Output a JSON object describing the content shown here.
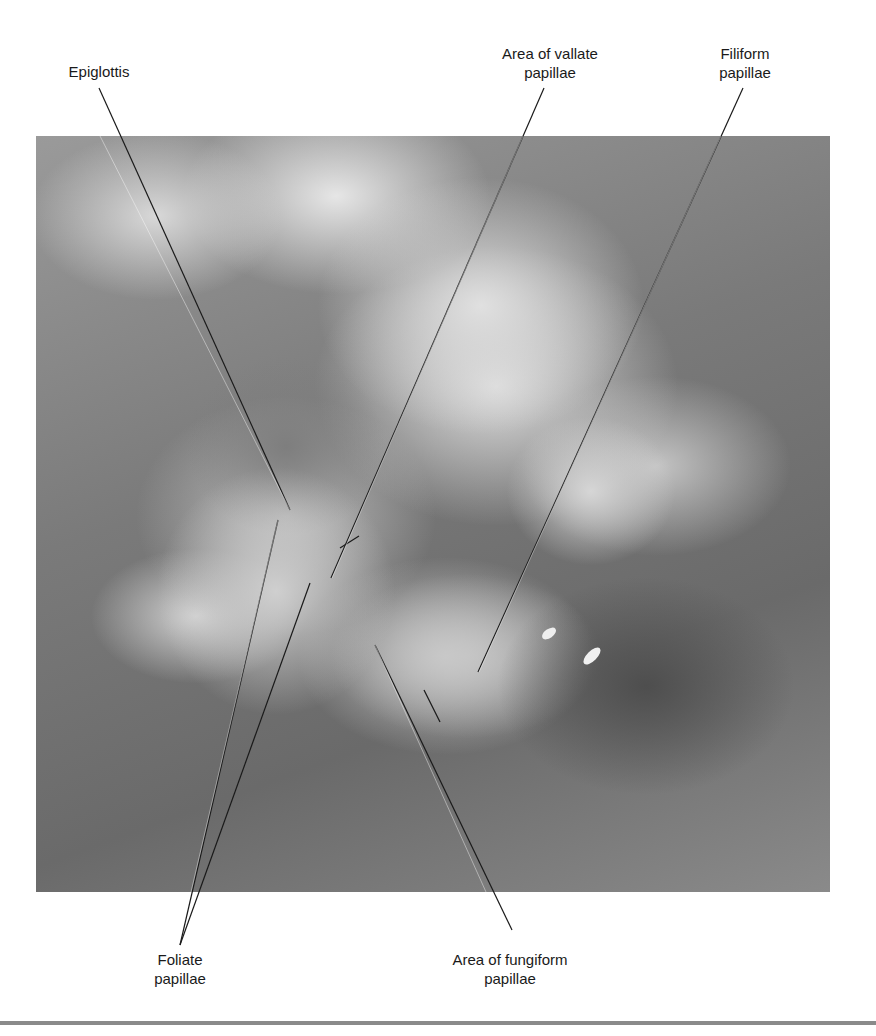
{
  "figure": {
    "photo_description": "Dissected cat head showing open oral cavity and tongue, grayscale photograph",
    "labels": {
      "epiglottis": "Epiglottis",
      "vallate": "Area of vallate\npapillae",
      "filiform": "Filiform\npapillae",
      "foliate": "Foliate\npapillae",
      "fungiform": "Area of fungiform\npapillae"
    },
    "colors": {
      "label_text": "#1a1a1a",
      "leader_line": "#1a1a1a",
      "bottom_rule": "#8a8a8a",
      "background": "#ffffff"
    }
  }
}
